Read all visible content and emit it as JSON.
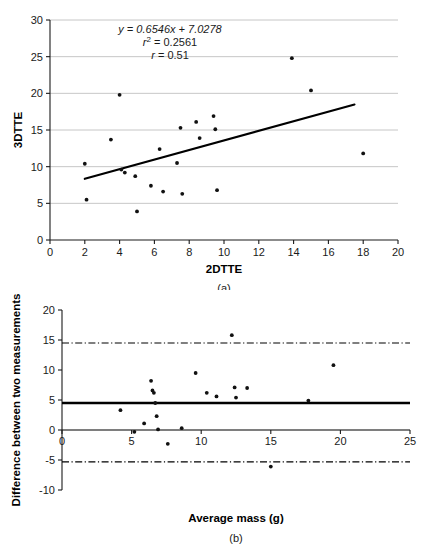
{
  "figure": {
    "panel_a_caption": "(a)",
    "panel_b_caption": "(b)"
  },
  "annotations": {
    "equation": "y = 0.6546x + 7.0278",
    "r_squared": "r2 = 0.2561",
    "r_squared_base": "r",
    "r_squared_sup": "2",
    "r_squared_value": " = 0.2561",
    "r_base": "r",
    "r_value": " = 0.51"
  },
  "chart_data": [
    {
      "id": "panel-a",
      "type": "scatter",
      "title": "",
      "xlabel": "2DTTE",
      "ylabel": "3DTTE",
      "xlim": [
        0,
        20
      ],
      "ylim": [
        0,
        30
      ],
      "xticks": [
        0,
        2,
        4,
        6,
        8,
        10,
        12,
        14,
        16,
        18,
        20
      ],
      "yticks": [
        0,
        5,
        10,
        15,
        20,
        25,
        30
      ],
      "xticklabels": [
        "0",
        "2",
        "4",
        "6",
        "8",
        "10",
        "12",
        "14",
        "16",
        "18",
        "20"
      ],
      "yticklabels": [
        "0",
        "5",
        "10",
        "15",
        "20",
        "25",
        "30"
      ],
      "grid": "horizontal",
      "legend": "none",
      "points": [
        {
          "x": 2.0,
          "y": 10.4
        },
        {
          "x": 2.1,
          "y": 5.5
        },
        {
          "x": 3.5,
          "y": 13.7
        },
        {
          "x": 4.0,
          "y": 19.8
        },
        {
          "x": 4.1,
          "y": 9.6
        },
        {
          "x": 4.3,
          "y": 9.2
        },
        {
          "x": 4.9,
          "y": 8.7
        },
        {
          "x": 5.0,
          "y": 3.9
        },
        {
          "x": 5.8,
          "y": 7.4
        },
        {
          "x": 6.3,
          "y": 12.4
        },
        {
          "x": 6.5,
          "y": 6.6
        },
        {
          "x": 7.3,
          "y": 10.5
        },
        {
          "x": 7.5,
          "y": 15.3
        },
        {
          "x": 7.6,
          "y": 6.3
        },
        {
          "x": 8.4,
          "y": 16.1
        },
        {
          "x": 8.6,
          "y": 13.9
        },
        {
          "x": 9.4,
          "y": 16.9
        },
        {
          "x": 9.5,
          "y": 15.1
        },
        {
          "x": 9.6,
          "y": 6.8
        },
        {
          "x": 13.9,
          "y": 24.8
        },
        {
          "x": 15.0,
          "y": 20.4
        },
        {
          "x": 18.0,
          "y": 11.8
        }
      ],
      "fit": {
        "slope": 0.6546,
        "intercept": 7.0278,
        "x_start": 2.0,
        "x_end": 17.5,
        "label": "y = 0.6546x + 7.0278",
        "r_squared": 0.2561,
        "r": 0.51
      }
    },
    {
      "id": "panel-b",
      "type": "scatter",
      "title": "",
      "xlabel": "Average mass (g)",
      "ylabel": "Difference between two measurements",
      "xlim": [
        0,
        25
      ],
      "ylim": [
        -10,
        20
      ],
      "xticks": [
        0,
        5,
        10,
        15,
        20,
        25
      ],
      "yticks": [
        -10,
        -5,
        0,
        5,
        10,
        15,
        20
      ],
      "xticklabels": [
        "0",
        "5",
        "10",
        "15",
        "20",
        "25"
      ],
      "yticklabels": [
        "-10",
        "-5",
        "0",
        "5",
        "10",
        "15",
        "20"
      ],
      "grid": "none",
      "legend": "none",
      "points": [
        {
          "x": 4.2,
          "y": 3.3
        },
        {
          "x": 5.2,
          "y": -0.3
        },
        {
          "x": 5.9,
          "y": 1.1
        },
        {
          "x": 6.4,
          "y": 8.2
        },
        {
          "x": 6.5,
          "y": 6.6
        },
        {
          "x": 6.6,
          "y": 6.2
        },
        {
          "x": 6.7,
          "y": 4.5
        },
        {
          "x": 6.8,
          "y": 2.3
        },
        {
          "x": 6.9,
          "y": 0.1
        },
        {
          "x": 7.6,
          "y": -2.3
        },
        {
          "x": 8.6,
          "y": 0.3
        },
        {
          "x": 9.6,
          "y": 9.5
        },
        {
          "x": 10.4,
          "y": 6.2
        },
        {
          "x": 11.1,
          "y": 5.6
        },
        {
          "x": 12.2,
          "y": 15.8
        },
        {
          "x": 12.4,
          "y": 7.1
        },
        {
          "x": 12.5,
          "y": 5.4
        },
        {
          "x": 13.3,
          "y": 7.0
        },
        {
          "x": 15.0,
          "y": -6.1
        },
        {
          "x": 17.7,
          "y": 4.9
        },
        {
          "x": 19.5,
          "y": 10.8
        }
      ],
      "mean_difference": 4.5,
      "upper_limit_of_agreement": 14.5,
      "lower_limit_of_agreement": -5.3
    }
  ]
}
